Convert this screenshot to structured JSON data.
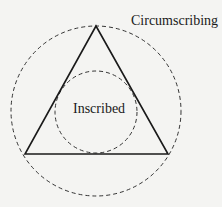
{
  "diagram": {
    "labels": {
      "outer": "Circumscribing",
      "inner": "Inscribed"
    },
    "shapes": {
      "triangle": {
        "points": [
          [
            96,
            26
          ],
          [
            25,
            154
          ],
          [
            168,
            154
          ]
        ],
        "stroke": "#1a1a1a"
      },
      "outer_circle": {
        "cx": 96,
        "cy": 111,
        "r": 85,
        "style": "dashed",
        "stroke": "#333333"
      },
      "inner_circle": {
        "cx": 96,
        "cy": 112,
        "r": 41,
        "style": "dashed",
        "stroke": "#333333"
      }
    }
  }
}
